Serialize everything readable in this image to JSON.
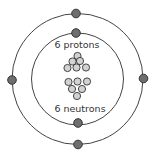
{
  "diagram": {
    "labels": {
      "protons": "6 protons",
      "neutrons": "6 neutrons"
    },
    "shells": [
      {
        "name": "inner",
        "electrons": 2
      },
      {
        "name": "outer",
        "electrons": 4
      }
    ],
    "nucleus": {
      "protons": 6,
      "neutrons": 6
    },
    "colors": {
      "electron": "#6e6e6e",
      "nucleon": "#d2d2d2",
      "stroke": "#333333",
      "shell": "#444444"
    }
  }
}
